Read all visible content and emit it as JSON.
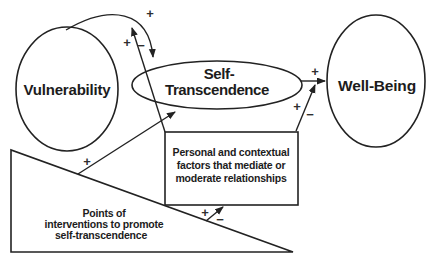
{
  "figure": {
    "background": "#ffffff",
    "line_color": "#222222",
    "text_color": "#1c1c1c",
    "nodes": {
      "vulnerability": {
        "label": "Vulnerability"
      },
      "self_transcendence": {
        "line1": "Self-",
        "line2": "Transcendence"
      },
      "well_being": {
        "label": "Well-Being"
      },
      "mediating_factors": {
        "line1": "Personal and contextual",
        "line2": "factors that mediate or",
        "line3": "moderate relationships"
      },
      "interventions": {
        "line1": "Points of",
        "line2": "interventions to promote",
        "line3": "self-transcendence"
      }
    },
    "signs": {
      "vulnerability_to_st": "+",
      "factors_on_vst_plus": "+",
      "factors_on_vst_minus": "−",
      "interventions_to_st": "+",
      "interventions_to_factors_plus": "+",
      "interventions_to_factors_minus": "−",
      "st_to_wellbeing": "+",
      "factors_on_stwb_plus": "+",
      "factors_on_stwb_minus": "−"
    }
  }
}
